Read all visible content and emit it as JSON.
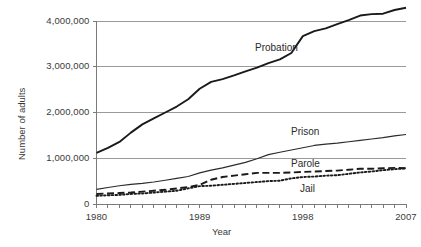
{
  "chart_data": {
    "type": "line",
    "title": "",
    "xlabel": "Year",
    "ylabel": "Number of adults",
    "xlim": [
      1980,
      2007
    ],
    "ylim": [
      0,
      4000000
    ],
    "grid": true,
    "legend_position": "inline-annotations",
    "x_tick_labels": [
      "1980",
      "1989",
      "1998",
      "2007"
    ],
    "x_tick_values": [
      1980,
      1989,
      1998,
      2007
    ],
    "y_tick_labels": [
      "0",
      "1,000,000",
      "2,000,000",
      "3,000,000",
      "4,000,000"
    ],
    "y_tick_values": [
      0,
      1000000,
      2000000,
      3000000,
      4000000
    ],
    "x": [
      1980,
      1981,
      1982,
      1983,
      1984,
      1985,
      1986,
      1987,
      1988,
      1989,
      1990,
      1991,
      1992,
      1993,
      1994,
      1995,
      1996,
      1997,
      1998,
      1999,
      2000,
      2001,
      2002,
      2003,
      2004,
      2005,
      2006,
      2007
    ],
    "series": [
      {
        "name": "Probation",
        "line_style": "solid",
        "color": "#1a1a1a",
        "values": [
          1118000,
          1225000,
          1357000,
          1560000,
          1740000,
          1870000,
          2000000,
          2130000,
          2290000,
          2520000,
          2670000,
          2730000,
          2810000,
          2900000,
          2980000,
          3080000,
          3160000,
          3300000,
          3670000,
          3780000,
          3840000,
          3930000,
          4020000,
          4120000,
          4150000,
          4160000,
          4240000,
          4290000
        ]
      },
      {
        "name": "Prison",
        "line_style": "solid",
        "color": "#2b2b2b",
        "values": [
          320000,
          360000,
          400000,
          430000,
          450000,
          480000,
          520000,
          560000,
          600000,
          680000,
          740000,
          790000,
          850000,
          910000,
          990000,
          1080000,
          1130000,
          1180000,
          1230000,
          1280000,
          1310000,
          1330000,
          1360000,
          1390000,
          1420000,
          1450000,
          1490000,
          1520000
        ]
      },
      {
        "name": "Parole",
        "line_style": "dashed",
        "color": "#1a1a1a",
        "values": [
          220000,
          230000,
          240000,
          250000,
          270000,
          290000,
          310000,
          340000,
          370000,
          420000,
          530000,
          590000,
          620000,
          650000,
          680000,
          680000,
          680000,
          690000,
          700000,
          710000,
          720000,
          730000,
          750000,
          770000,
          770000,
          780000,
          790000,
          780000
        ]
      },
      {
        "name": "Jail",
        "line_style": "dotted",
        "color": "#1a1a1a",
        "values": [
          180000,
          190000,
          200000,
          220000,
          230000,
          250000,
          270000,
          290000,
          340000,
          390000,
          400000,
          420000,
          440000,
          460000,
          480000,
          500000,
          510000,
          560000,
          590000,
          600000,
          620000,
          630000,
          660000,
          690000,
          710000,
          740000,
          760000,
          780000
        ]
      }
    ],
    "annotations": [
      {
        "text": "Probation",
        "x_px": 255,
        "y_px": 42
      },
      {
        "text": "Prison",
        "x_px": 291,
        "y_px": 126
      },
      {
        "text": "Parole",
        "x_px": 291,
        "y_px": 158
      },
      {
        "text": "Jail",
        "x_px": 300,
        "y_px": 183
      }
    ]
  }
}
